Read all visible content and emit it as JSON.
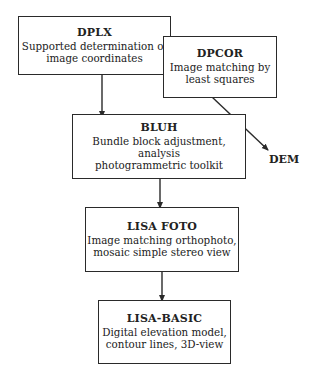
{
  "diagram": {
    "nodes": [
      {
        "id": "dplx",
        "title": "DPLX",
        "lines": [
          "Supported determination of",
          "image coordinates"
        ]
      },
      {
        "id": "dpcor",
        "title": "DPCOR",
        "lines": [
          "Image matching by",
          "least squares"
        ]
      },
      {
        "id": "bluh",
        "title": "BLUH",
        "lines": [
          "Bundle block adjustment, analysis",
          "photogrammetric toolkit"
        ]
      },
      {
        "id": "lisa_foto",
        "title": "LISA FOTO",
        "lines": [
          "Image matching orthophoto,",
          "mosaic simple stereo view"
        ]
      },
      {
        "id": "lisa_basic",
        "title": "LISA-BASIC",
        "lines": [
          "Digital elevation model,",
          "contour lines, 3D-view"
        ]
      }
    ],
    "outputs": [
      {
        "id": "dem",
        "label": "DEM"
      }
    ],
    "edges": [
      {
        "from": "dplx",
        "to": "bluh"
      },
      {
        "from": "dpcor",
        "to": "dem"
      },
      {
        "from": "bluh",
        "to": "lisa_foto"
      },
      {
        "from": "lisa_foto",
        "to": "lisa_basic"
      }
    ],
    "colors": {
      "stroke": "#2a2a2a",
      "fill": "#ffffff",
      "text": "#222222"
    }
  }
}
